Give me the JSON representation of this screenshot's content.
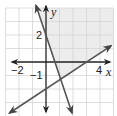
{
  "graph": {
    "type": "system_of_linear_inequalities",
    "x_axis": {
      "label": "x",
      "tick_labels": [
        {
          "value": -2,
          "text": "−2"
        },
        {
          "value": 4,
          "text": "4"
        }
      ],
      "range": [
        -3,
        5
      ]
    },
    "y_axis": {
      "label": "y",
      "tick_labels": [
        {
          "value": 2,
          "text": "2"
        },
        {
          "value": -1,
          "text": "−1"
        }
      ],
      "range": [
        -4,
        4
      ]
    },
    "grid": true,
    "grid_step": 1,
    "lines": [
      {
        "name": "steep-line",
        "equation": "y = -3x + 2",
        "slope": -3,
        "intercept": 2,
        "style": "solid"
      },
      {
        "name": "gentle-line",
        "equation": "y = (2/3)x - 2",
        "slope": 0.6667,
        "intercept": -2,
        "style": "solid"
      }
    ],
    "shaded_region": {
      "description": "above y = (2/3)x - 2 and to the right of y = -3x + 2",
      "color": "#ececec"
    },
    "colors": {
      "line": "#555555",
      "axis": "#333333",
      "grid": "#d4d4d4",
      "shade": "#ececec"
    }
  }
}
